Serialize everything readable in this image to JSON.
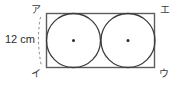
{
  "figure": {
    "type": "geometry-diagram",
    "stroke_color": "#4a4a4a",
    "rect_stroke_color": "#5a5a5a",
    "text_color": "#2b2b2b",
    "background": "#ffffff",
    "dimension": {
      "value": "12",
      "unit": "cm",
      "full_text": "12 cm",
      "applies_to": "left side (ア to イ)"
    },
    "vertices": [
      {
        "id": "top-left",
        "label": "ア"
      },
      {
        "id": "top-right",
        "label": "エ"
      },
      {
        "id": "bottom-right",
        "label": "ウ"
      },
      {
        "id": "bottom-left",
        "label": "イ"
      }
    ],
    "rectangle": {
      "x": 46,
      "y": 13,
      "width": 109,
      "height": 55
    },
    "circles": [
      {
        "id": "left-circle",
        "cx": 73.5,
        "cy": 40.5,
        "r": 27.5,
        "center_dot": true
      },
      {
        "id": "right-circle",
        "cx": 128.5,
        "cy": 40.5,
        "r": 27.5,
        "center_dot": true
      }
    ],
    "dimension_arc": {
      "from_x": 40,
      "from_y": 17,
      "to_x": 41,
      "to_y": 66,
      "style": "dashed"
    }
  }
}
